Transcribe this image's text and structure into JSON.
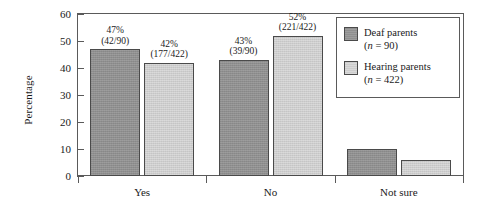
{
  "chart_data": {
    "type": "bar",
    "title": "",
    "subtitle": "",
    "xlabel": "",
    "ylabel": "Percentage",
    "ylim": [
      0,
      60
    ],
    "yticks": [
      0,
      10,
      20,
      30,
      40,
      50,
      60
    ],
    "ytick_labels": [
      "0",
      "10",
      "20",
      "30",
      "40",
      "50",
      "60"
    ],
    "grid": false,
    "legend_position": "top-right",
    "categories": [
      "Yes",
      "No",
      "Not sure"
    ],
    "series": [
      {
        "name": "Deaf parents",
        "legend_sub": "(n = 90)",
        "n": 90,
        "color": "#8f8f8f",
        "values": [
          47,
          43,
          10
        ],
        "labels": [
          "47%",
          "43%",
          ""
        ],
        "sublabels": [
          "(42/90)",
          "(39/90)",
          ""
        ]
      },
      {
        "name": "Hearing parents",
        "legend_sub": "(n = 422)",
        "n": 422,
        "color": "#cdcdcd",
        "values": [
          42,
          52,
          6
        ],
        "labels": [
          "42%",
          "52%",
          ""
        ],
        "sublabels": [
          "(177/422)",
          "(221/422)",
          ""
        ]
      }
    ]
  },
  "legend": {
    "entries": [
      {
        "label": "Deaf parents",
        "sub_prefix": "(",
        "sub_var": "n",
        "sub_rest": " = 90)"
      },
      {
        "label": "Hearing parents",
        "sub_prefix": "(",
        "sub_var": "n",
        "sub_rest": " = 422)"
      }
    ]
  },
  "axes": {
    "y_title": "Percentage"
  }
}
